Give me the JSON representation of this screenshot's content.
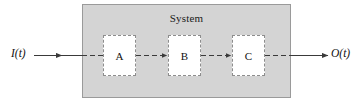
{
  "diagram": {
    "system": {
      "label": "System",
      "fill_color": "#d4d4d4",
      "border_color": "#9a9a9a"
    },
    "input": {
      "label": "I(t)",
      "name": "input-signal"
    },
    "output": {
      "label": "O(t)",
      "name": "output-signal"
    },
    "blocks": [
      {
        "label": "A",
        "name": "block-a"
      },
      {
        "label": "B",
        "name": "block-b"
      },
      {
        "label": "C",
        "name": "block-c"
      }
    ],
    "connectors": {
      "input_arrow": "solid-arrow-right",
      "internal_links": "dashed-arrow-right",
      "output_arrow": "solid-arrow-right",
      "line_color": "#3a3a3a"
    }
  }
}
